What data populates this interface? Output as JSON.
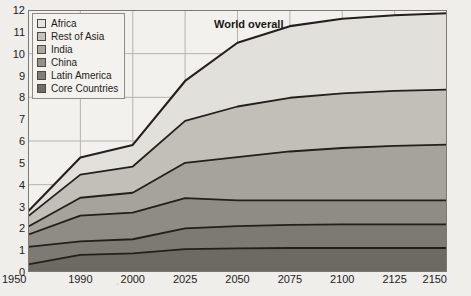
{
  "chart_data": {
    "type": "area",
    "stacked": true,
    "title": "",
    "annotation": "World overall",
    "xlabel": "",
    "ylabel": "",
    "x": [
      1950,
      1990,
      2000,
      2025,
      2050,
      2075,
      2100,
      2125,
      2150
    ],
    "x_tick_labels": [
      "1950",
      "1990",
      "2000",
      "2025",
      "2050",
      "2075",
      "2100",
      "2125",
      "2150"
    ],
    "y_tick_labels": [
      "0",
      "1",
      "2",
      "3",
      "4",
      "5",
      "6",
      "7",
      "8",
      "9",
      "10",
      "11",
      "12"
    ],
    "ylim": [
      0,
      12
    ],
    "xlim": [
      1950,
      2150
    ],
    "grid": true,
    "legend_position": "top-left",
    "series": [
      {
        "name": "Core Countries",
        "color": "#6d6a63",
        "values": [
          0.35,
          0.78,
          0.85,
          1.05,
          1.08,
          1.1,
          1.1,
          1.1,
          1.1
        ]
      },
      {
        "name": "Latin America",
        "color": "#7d7a73",
        "values": [
          0.8,
          0.62,
          0.65,
          0.95,
          1.02,
          1.06,
          1.08,
          1.08,
          1.08
        ]
      },
      {
        "name": "China",
        "color": "#8f8c85",
        "values": [
          0.56,
          1.18,
          1.22,
          1.38,
          1.18,
          1.12,
          1.1,
          1.1,
          1.1
        ]
      },
      {
        "name": "India",
        "color": "#a6a39c",
        "values": [
          0.36,
          0.82,
          0.91,
          1.62,
          1.98,
          2.24,
          2.4,
          2.5,
          2.55
        ]
      },
      {
        "name": "Rest of Asia",
        "color": "#c2bfb8",
        "values": [
          0.48,
          1.06,
          1.2,
          1.92,
          2.32,
          2.46,
          2.5,
          2.52,
          2.52
        ]
      },
      {
        "name": "Africa",
        "color": "#e2e0da",
        "values": [
          0.22,
          0.78,
          0.99,
          1.83,
          2.92,
          3.28,
          3.42,
          3.46,
          3.5
        ]
      }
    ],
    "totals": [
      2.77,
      5.24,
      5.82,
      8.75,
      10.5,
      11.26,
      11.6,
      11.76,
      11.85
    ]
  },
  "legend": {
    "items": [
      {
        "label": "Africa",
        "color": "#e6e4de"
      },
      {
        "label": "Rest of Asia",
        "color": "#c6c3bc"
      },
      {
        "label": "India",
        "color": "#aba89f"
      },
      {
        "label": "China",
        "color": "#949189"
      },
      {
        "label": "Latin America",
        "color": "#817e76"
      },
      {
        "label": "Core Countries",
        "color": "#6f6c65"
      }
    ]
  },
  "annotation": {
    "world_overall": "World overall"
  }
}
